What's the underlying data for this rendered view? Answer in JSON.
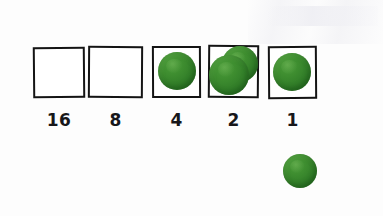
{
  "scene": {
    "kind": "handwritten-binary-place-value-chart",
    "background_color": "#fdfdfd",
    "ink_color": "#141414",
    "counter_color": "#3d8c2f",
    "width": 383,
    "height": 216
  },
  "chart_data": {
    "type": "table",
    "title": "",
    "xlabel": "",
    "ylabel": "",
    "categories": [
      "16",
      "8",
      "4",
      "2",
      "1"
    ],
    "values": [
      0,
      1,
      1,
      2,
      1
    ]
  },
  "places": [
    {
      "label": "16",
      "counter_count": 0,
      "box": {
        "x": 33,
        "y": 47,
        "w": 52,
        "h": 51,
        "tilt": "skew-a"
      },
      "label_pos": {
        "x": 33,
        "y": 112,
        "w": 52
      },
      "counters": []
    },
    {
      "label": "8",
      "counter_count": 0,
      "box": {
        "x": 88,
        "y": 46,
        "w": 55,
        "h": 52,
        "tilt": "skew-b"
      },
      "label_pos": {
        "x": 88,
        "y": 112,
        "w": 55
      },
      "counters": []
    },
    {
      "label": "4",
      "counter_count": 1,
      "box": {
        "x": 152,
        "y": 46,
        "w": 49,
        "h": 52,
        "tilt": "skew-c"
      },
      "label_pos": {
        "x": 152,
        "y": 112,
        "w": 49
      },
      "counters": [
        {
          "cx": 177,
          "cy": 71,
          "r": 19
        }
      ]
    },
    {
      "label": "2",
      "counter_count": 2,
      "box": {
        "x": 208,
        "y": 45,
        "w": 51,
        "h": 53,
        "tilt": "skew-d"
      },
      "label_pos": {
        "x": 208,
        "y": 112,
        "w": 51
      },
      "counters": [
        {
          "cx": 240,
          "cy": 64,
          "r": 18
        },
        {
          "cx": 229,
          "cy": 75,
          "r": 20
        }
      ]
    },
    {
      "label": "1",
      "counter_count": 1,
      "box": {
        "x": 268,
        "y": 46,
        "w": 49,
        "h": 53,
        "tilt": "skew-e"
      },
      "label_pos": {
        "x": 268,
        "y": 112,
        "w": 49
      },
      "counters": [
        {
          "cx": 292,
          "cy": 72,
          "r": 19
        }
      ]
    }
  ],
  "loose_counters": [
    {
      "cx": 300,
      "cy": 171,
      "r": 17
    }
  ]
}
